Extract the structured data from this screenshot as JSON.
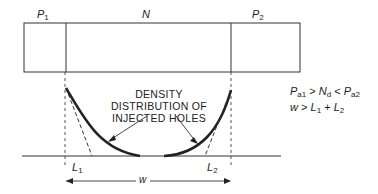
{
  "diagram": {
    "regions": [
      {
        "id": "p1",
        "label": "P",
        "subscript": "1"
      },
      {
        "id": "n",
        "label": "N",
        "subscript": ""
      },
      {
        "id": "p2",
        "label": "P",
        "subscript": "2"
      }
    ],
    "curve_label": [
      "DENSITY",
      "DISTRIBUTION OF",
      "INJECTED HOLES"
    ],
    "diffusion_lengths": [
      {
        "label": "L",
        "subscript": "1"
      },
      {
        "label": "L",
        "subscript": "2"
      }
    ],
    "width_label": "w",
    "conditions": {
      "line1": {
        "a": "P",
        "a_sub": "a1",
        "op1": " > ",
        "b": "N",
        "b_sub": "d",
        "op2": " < ",
        "c": "P",
        "c_sub": "a2"
      },
      "line2": {
        "lhs": "w",
        "op": " > ",
        "r1": "L",
        "r1_sub": "1",
        "plus": " + ",
        "r2": "L",
        "r2_sub": "2"
      }
    },
    "colors": {
      "ink": "#222222",
      "background": "#ffffff"
    }
  }
}
